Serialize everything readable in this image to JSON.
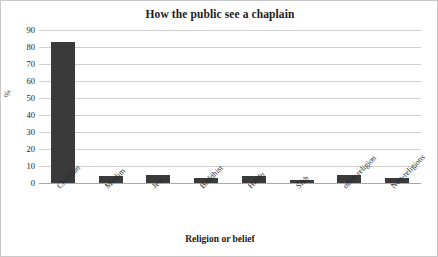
{
  "chart_data": {
    "type": "bar",
    "title": "How the public see a chaplain",
    "xlabel": "Religion or belief",
    "ylabel": "%",
    "categories": [
      "Christian",
      "Muslim",
      "Jew",
      "Buddhist",
      "Hindu",
      "Sikh",
      "other religion",
      "Non-religious"
    ],
    "values": [
      83,
      4,
      5,
      3,
      4,
      2,
      5,
      3
    ],
    "ylim": [
      0,
      90
    ],
    "ytick_step": 10,
    "ytick_labels": [
      "0",
      "10",
      "20",
      "30",
      "40",
      "50",
      "60",
      "70",
      "80",
      "90"
    ],
    "grid": true,
    "legend": false,
    "bar_color": "#3a3a3a",
    "gridline_color": "#cfcfcf",
    "axis_color": "#a9a9a9",
    "background_color": "#ffffff"
  }
}
